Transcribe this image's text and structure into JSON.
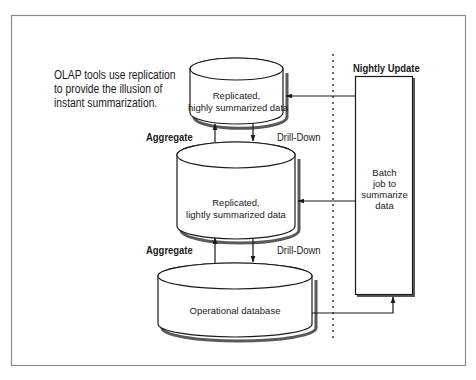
{
  "diagram": {
    "caption": {
      "line1": "OLAP tools use replication",
      "line2": "to provide the illusion of",
      "line3": "instant summarization."
    },
    "nodes": {
      "top_store": {
        "line1": "Replicated,",
        "line2": "highly summarized data",
        "shape": "cylinder"
      },
      "middle_store": {
        "line1": "Replicated,",
        "line2": "lightly summarized data",
        "shape": "cylinder"
      },
      "bottom_store": {
        "label": "Operational database",
        "shape": "cylinder"
      },
      "batch_job": {
        "line1": "Batch",
        "line2": "job to",
        "line3": "summarize",
        "line4": "data",
        "shape": "rectangle"
      }
    },
    "labels": {
      "nightly_update": "Nightly Update",
      "aggregate_upper": "Aggregate",
      "drilldown_upper": "Drill-Down",
      "aggregate_lower": "Aggregate",
      "drilldown_lower": "Drill-Down"
    },
    "edges": [
      {
        "from": "middle_store",
        "to": "top_store",
        "label": "Aggregate"
      },
      {
        "from": "top_store",
        "to": "middle_store",
        "label": "Drill-Down"
      },
      {
        "from": "bottom_store",
        "to": "middle_store",
        "label": "Aggregate"
      },
      {
        "from": "middle_store",
        "to": "bottom_store",
        "label": "Drill-Down"
      },
      {
        "from": "batch_job",
        "to": "top_store",
        "label": ""
      },
      {
        "from": "batch_job",
        "to": "middle_store",
        "label": ""
      },
      {
        "from": "bottom_store",
        "to": "batch_job",
        "label": ""
      }
    ],
    "colors": {
      "stroke": "#1a1a1a",
      "frame": "#8a8a8a",
      "shadow": "#6e6e6e",
      "background": "#ffffff"
    }
  }
}
